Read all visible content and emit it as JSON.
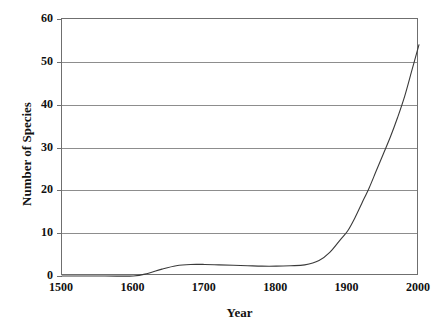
{
  "chart_data": {
    "type": "line",
    "title": "",
    "xlabel": "Year",
    "ylabel": "Number of Species",
    "xlim": [
      1500,
      2000
    ],
    "ylim": [
      0,
      60
    ],
    "xticks": [
      "1500",
      "1600",
      "1700",
      "1800",
      "1900",
      "2000"
    ],
    "yticks": [
      "0",
      "10",
      "20",
      "30",
      "40",
      "50",
      "60"
    ],
    "grid": "horizontal",
    "legend": "none",
    "series": [
      {
        "name": "Cumulative number of species",
        "x": [
          1500,
          1560,
          1600,
          1620,
          1640,
          1660,
          1680,
          1700,
          1720,
          1740,
          1760,
          1780,
          1800,
          1820,
          1840,
          1860,
          1875,
          1890,
          1900,
          1910,
          1920,
          1930,
          1940,
          1950,
          1960,
          1970,
          1980,
          1990,
          2000
        ],
        "y": [
          0,
          0,
          0,
          0.6,
          1.6,
          2.4,
          2.7,
          2.7,
          2.6,
          2.5,
          2.4,
          2.3,
          2.3,
          2.4,
          2.6,
          3.6,
          5.5,
          8.5,
          10.5,
          13.5,
          17,
          20.5,
          24.5,
          28.5,
          32.5,
          37,
          42,
          48,
          54
        ]
      }
    ]
  },
  "axes": {
    "x_title": "Year",
    "y_title": "Number of Species"
  },
  "colors": {
    "curve": "#3a3a3a",
    "grid": "#8d8d8d",
    "frame": "#6f6f6f",
    "text": "#111111",
    "background": "#ffffff"
  }
}
